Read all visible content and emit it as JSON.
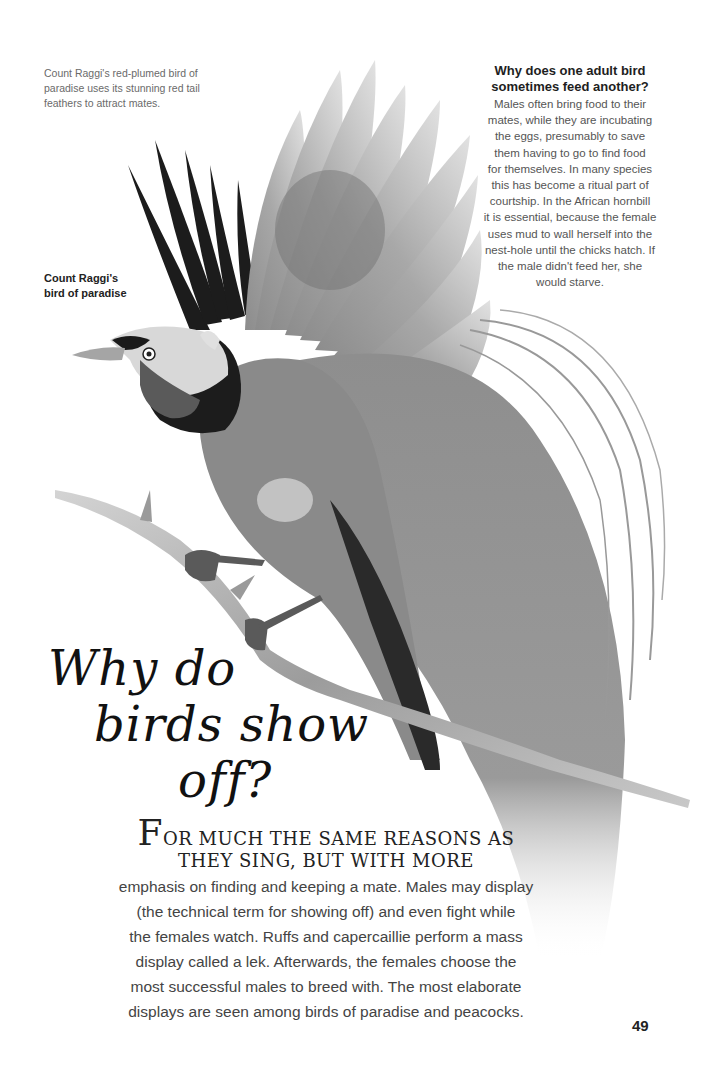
{
  "caption": {
    "text": "Count Raggi's red-plumed bird of paradise uses its stunning red tail feathers to attract mates."
  },
  "bird_label": {
    "line1": "Count Raggi's",
    "line2": "bird of paradise"
  },
  "sidebar": {
    "question_line1": "Why does one adult bird",
    "question_line2": "sometimes feed another?",
    "answer_lines": [
      "Males often bring food to their",
      "mates, while they are incubating",
      "the eggs, presumably to save",
      "them having to go to find food",
      "for themselves. In many species",
      "this has become a ritual part of",
      "courtship. In the African hornbill",
      "it is essential, because the female",
      "uses mud to wall herself into the",
      "nest-hole until the chicks hatch. If",
      "the male didn't feed her, she",
      "would starve."
    ]
  },
  "headline": {
    "line1": "Why do",
    "line2": "birds show",
    "line3": "off?"
  },
  "intro": {
    "drop_cap": "F",
    "caps_line1": "OR MUCH THE SAME REASONS AS",
    "caps_line2": "THEY SING, BUT WITH MORE",
    "body_lines": [
      "emphasis on finding and keeping a mate. Males may display",
      "(the technical term for showing off) and even fight while",
      "the females watch. Ruffs and capercaillie perform a mass",
      "display called a lek. Afterwards, the females choose the",
      "most successful males to breed with. The most elaborate",
      "displays are seen among birds of paradise and peacocks."
    ]
  },
  "illustration": {
    "subject": "bird-of-paradise-on-branch",
    "palette": {
      "dark": "#1a1a1a",
      "mid": "#8a8a8a",
      "light": "#d6d6d6",
      "branch": "#b0b0b0"
    }
  },
  "page_number": "49"
}
